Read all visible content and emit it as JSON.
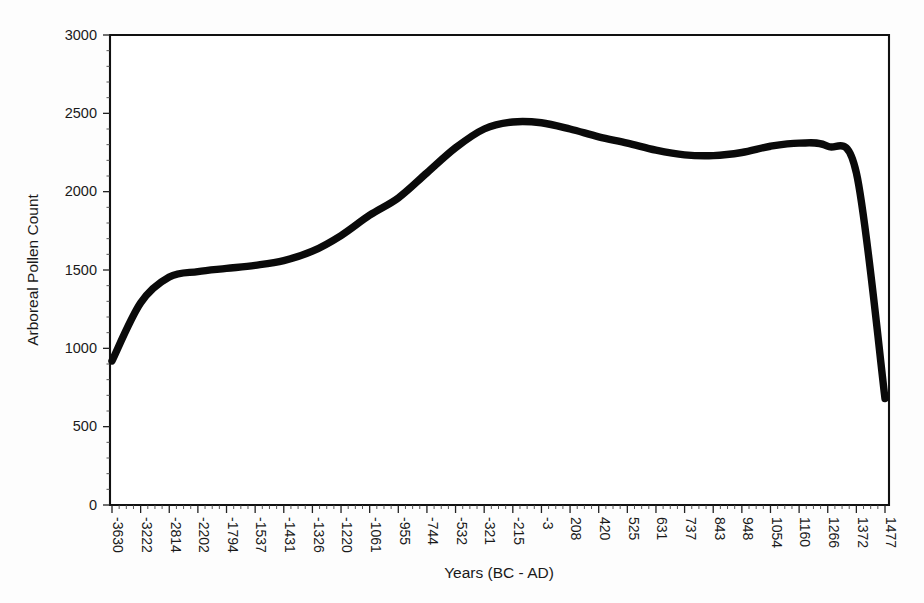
{
  "chart_data": {
    "type": "line",
    "title": "",
    "xlabel": "Years (BC - AD)",
    "ylabel": "Arboreal Pollen Count",
    "xlim": [
      0,
      30
    ],
    "ylim": [
      0,
      3000
    ],
    "grid": false,
    "legend": false,
    "legend_position": "none",
    "y_ticks": [
      0,
      500,
      1000,
      1500,
      2000,
      2500,
      3000
    ],
    "y_tick_labels": [
      "0",
      "500",
      "1000",
      "1500",
      "2000",
      "2500",
      "3000"
    ],
    "x_tick_labels": [
      "-3630",
      "-3222",
      "-2814",
      "-2202",
      "-1794",
      "-1537",
      "-1431",
      "-1326",
      "-1220",
      "-1061",
      "-955",
      "-744",
      "-532",
      "-321",
      "-215",
      "-3",
      "208",
      "420",
      "525",
      "631",
      "737",
      "843",
      "948",
      "1054",
      "1160",
      "1266",
      "1372",
      "1477"
    ],
    "categories": [
      "-3630",
      "-3222",
      "-2814",
      "-2202",
      "-1794",
      "-1537",
      "-1431",
      "-1326",
      "-1220",
      "-1061",
      "-955",
      "-744",
      "-532",
      "-321",
      "-215",
      "-3",
      "208",
      "420",
      "525",
      "631",
      "737",
      "843",
      "948",
      "1054",
      "1160",
      "1266",
      "1372",
      "1477"
    ],
    "series": [
      {
        "name": "Arboreal Pollen Count",
        "color": "#0a0a0a",
        "values": [
          920,
          1290,
          1455,
          1490,
          1510,
          1530,
          1560,
          1620,
          1720,
          1850,
          1960,
          2120,
          2280,
          2400,
          2445,
          2440,
          2400,
          2350,
          2310,
          2265,
          2235,
          2230,
          2250,
          2290,
          2310,
          2290,
          2120,
          680
        ]
      }
    ],
    "line_style": "smooth",
    "line_width": 7,
    "background_color": "#fdfdfd",
    "axis_color": "#111111"
  },
  "axes": {
    "x_title": "Years (BC - AD)",
    "y_title": "Arboreal Pollen Count"
  }
}
